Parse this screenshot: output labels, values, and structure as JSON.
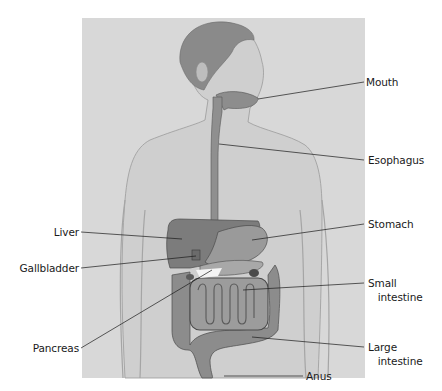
{
  "diagram": {
    "type": "anatomy-illustration",
    "colors": {
      "panel_background": "#d8d8d8",
      "page_background": "#ffffff",
      "label_text": "#1a1a1a",
      "leader_line": "#1a1a1a",
      "organ_shading": "#7a7a7a"
    },
    "labels": {
      "mouth": "Mouth",
      "esophagus": "Esophagus",
      "stomach": "Stomach",
      "small_intestine": "Small\n   intestine",
      "large_intestine": "Large\n   intestine",
      "anus": "Anus",
      "liver": "Liver",
      "gallbladder": "Gallbladder",
      "pancreas": "Pancreas"
    }
  }
}
